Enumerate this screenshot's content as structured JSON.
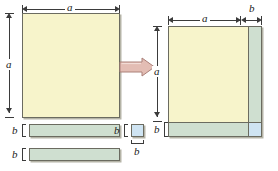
{
  "figure": {
    "transform_icon": "right-arrow-icon",
    "colors": {
      "square_a": "#f7f4cb",
      "rect_ab": "#cfdfd0",
      "square_b": "#cfe4f2",
      "outline": "#6b6b60",
      "dimension_line": "#3b3b3b",
      "arrow_fill": "#e3bdb4",
      "arrow_outline": "#b08a82",
      "background": "#ffffff"
    }
  },
  "labels": {
    "a": "a",
    "b": "b"
  },
  "left_panel": {
    "name": "pieces-before",
    "big_square": {
      "name": "square-a-by-a",
      "width_label": "a",
      "height_label": "a"
    },
    "rect_1": {
      "name": "rect-a-by-b-1",
      "height_label": "b"
    },
    "rect_2": {
      "name": "rect-a-by-b-2",
      "height_label": "b"
    },
    "small_square": {
      "name": "square-b-by-b",
      "height_label": "b",
      "width_label": "b"
    },
    "dimensions": {
      "top": "a",
      "left": "a",
      "rect1_left": "b",
      "rect2_left": "b",
      "small_left": "b",
      "small_bottom": "b"
    }
  },
  "right_panel": {
    "name": "assembled-square",
    "dimensions": {
      "top_a": "a",
      "top_b": "b",
      "left_a": "a",
      "left_b": "b"
    },
    "regions": {
      "core": {
        "name": "region-a-squared"
      },
      "right_strip": {
        "name": "region-ab-right"
      },
      "bottom_strip": {
        "name": "region-ab-bottom"
      },
      "corner": {
        "name": "region-b-squared"
      }
    }
  }
}
